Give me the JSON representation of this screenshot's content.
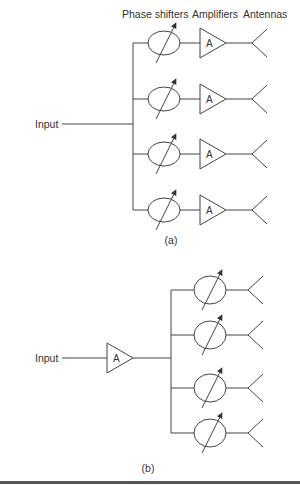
{
  "diagram_a": {
    "headers": {
      "phase_shifters": "Phase shifters",
      "amplifiers": "Amplifiers",
      "antennas": "Antennas"
    },
    "input_label": "Input",
    "amplifier_symbol": "A",
    "branch_count": 4,
    "branches": [
      {
        "components": [
          "phase-shifter",
          "amplifier",
          "antenna"
        ]
      },
      {
        "components": [
          "phase-shifter",
          "amplifier",
          "antenna"
        ]
      },
      {
        "components": [
          "phase-shifter",
          "amplifier",
          "antenna"
        ]
      },
      {
        "components": [
          "phase-shifter",
          "amplifier",
          "antenna"
        ]
      }
    ],
    "caption": "(a)"
  },
  "diagram_b": {
    "input_label": "Input",
    "amplifier_symbol": "A",
    "branch_count": 4,
    "branches": [
      {
        "components": [
          "phase-shifter",
          "antenna"
        ]
      },
      {
        "components": [
          "phase-shifter",
          "antenna"
        ]
      },
      {
        "components": [
          "phase-shifter",
          "antenna"
        ]
      },
      {
        "components": [
          "phase-shifter",
          "antenna"
        ]
      }
    ],
    "caption": "(b)"
  },
  "colors": {
    "stroke": "#444444",
    "text": "#333333",
    "background": "#ffffff",
    "rule": "#555555"
  }
}
